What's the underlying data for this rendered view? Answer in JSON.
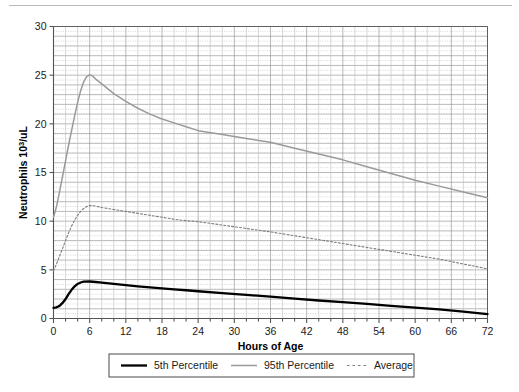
{
  "chart_data": {
    "type": "line",
    "title": "",
    "xlabel": "Hours of Age",
    "ylabel": "Neutrophils 10",
    "ylabel_sup": "3",
    "ylabel_tail": "/uL",
    "xlim": [
      0,
      72
    ],
    "ylim": [
      0,
      30
    ],
    "xticks": [
      0,
      6,
      12,
      18,
      24,
      30,
      36,
      42,
      48,
      54,
      60,
      66,
      72
    ],
    "yticks": [
      0,
      5,
      10,
      15,
      20,
      25,
      30
    ],
    "xtick_labels": [
      "0",
      "6",
      "12",
      "18",
      "24",
      "30",
      "36",
      "42",
      "48",
      "54",
      "60",
      "66",
      "72"
    ],
    "ytick_labels": [
      "0",
      "5",
      "10",
      "15",
      "20",
      "25",
      "30"
    ],
    "grid": true,
    "grid_major_y_step": 1,
    "grid_minor_y_step": 0.5,
    "grid_major_x_step": 2,
    "legend_position": "bottom",
    "series": [
      {
        "name": "5th Percentile",
        "style": "solid-thick",
        "color": "#000000",
        "x": [
          0,
          0.5,
          1,
          1.5,
          2,
          2.5,
          3,
          3.5,
          4,
          4.5,
          5,
          6,
          7,
          8,
          10,
          12,
          14,
          16,
          18,
          20,
          22,
          24,
          28,
          32,
          36,
          40,
          44,
          48,
          52,
          56,
          60,
          64,
          68,
          72
        ],
        "values": [
          1.1,
          1.15,
          1.3,
          1.6,
          2.0,
          2.5,
          2.95,
          3.3,
          3.55,
          3.7,
          3.78,
          3.8,
          3.75,
          3.68,
          3.55,
          3.42,
          3.3,
          3.2,
          3.1,
          3.0,
          2.9,
          2.8,
          2.6,
          2.42,
          2.25,
          2.05,
          1.85,
          1.68,
          1.5,
          1.3,
          1.12,
          0.93,
          0.7,
          0.45
        ]
      },
      {
        "name": "95th Percentile",
        "style": "solid-gray",
        "color": "#9a9a9a",
        "x": [
          0,
          0.5,
          1,
          1.5,
          2,
          2.5,
          3,
          3.5,
          4,
          4.5,
          5,
          5.5,
          6,
          6.5,
          7,
          8,
          10,
          12,
          14,
          16,
          18,
          20,
          22,
          24,
          28,
          32,
          36,
          40,
          44,
          48,
          52,
          56,
          60,
          64,
          68,
          72
        ],
        "values": [
          10.4,
          11.5,
          13.0,
          14.6,
          16.2,
          17.8,
          19.3,
          20.8,
          22.2,
          23.4,
          24.3,
          24.85,
          25.05,
          24.9,
          24.6,
          24.1,
          23.1,
          22.3,
          21.6,
          21.0,
          20.5,
          20.1,
          19.7,
          19.3,
          18.9,
          18.5,
          18.1,
          17.5,
          16.9,
          16.3,
          15.6,
          14.9,
          14.2,
          13.6,
          13.0,
          12.4
        ]
      },
      {
        "name": "Average",
        "style": "dotted",
        "color": "#7d7d7d",
        "x": [
          0,
          0.5,
          1,
          1.5,
          2,
          2.5,
          3,
          3.5,
          4,
          4.5,
          5,
          5.5,
          6,
          6.5,
          7,
          8,
          10,
          12,
          14,
          16,
          18,
          20,
          22,
          24,
          28,
          32,
          36,
          40,
          44,
          48,
          52,
          56,
          60,
          64,
          68,
          72
        ],
        "values": [
          4.9,
          5.6,
          6.4,
          7.2,
          8.0,
          8.8,
          9.5,
          10.1,
          10.6,
          11.0,
          11.3,
          11.5,
          11.6,
          11.6,
          11.55,
          11.4,
          11.2,
          11.0,
          10.8,
          10.6,
          10.4,
          10.2,
          10.05,
          9.95,
          9.6,
          9.25,
          8.9,
          8.5,
          8.1,
          7.7,
          7.3,
          6.9,
          6.5,
          6.1,
          5.6,
          5.1
        ]
      }
    ],
    "legend": [
      {
        "label": "5th Percentile",
        "style": "solid-thick",
        "color": "#000000"
      },
      {
        "label": "95th Percentile",
        "style": "solid-gray",
        "color": "#9a9a9a"
      },
      {
        "label": "Average",
        "style": "dotted",
        "color": "#7d7d7d"
      }
    ]
  },
  "colors": {
    "axis": "#555555",
    "grid_major": "#8a8a8a",
    "grid_minor": "#bdbdbd",
    "background": "#ffffff"
  }
}
